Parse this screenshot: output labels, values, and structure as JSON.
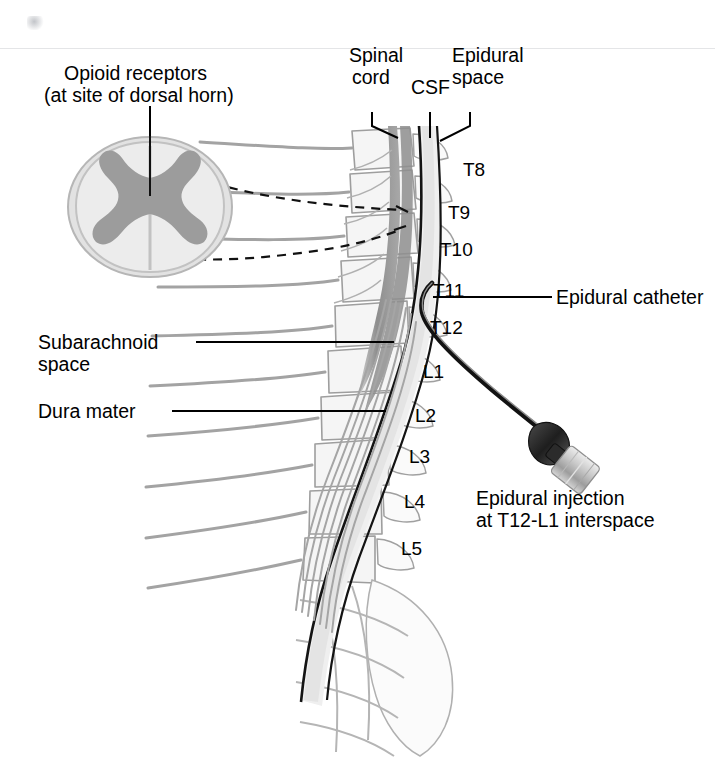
{
  "figure": {
    "type": "medical-anatomical-diagram",
    "background_color": "#ffffff"
  },
  "colors": {
    "ink": "#000000",
    "bone_outline": "#9a9a9a",
    "bone_fill": "#f4f4f4",
    "cord_gray": "#8c8c8c",
    "gray_matter": "#9a9a9a",
    "white_matter": "#d8d8d8",
    "csf_light": "#e8e8e8",
    "catheter": "#1a1a1a",
    "hub_gray": "#b5b5b5",
    "dashed": "#1a1a1a"
  },
  "callouts": {
    "opioid_receptors": {
      "line1": "Opioid receptors",
      "line2": "(at site of dorsal horn)"
    },
    "spinal_cord": {
      "line1": "Spinal",
      "line2": "cord"
    },
    "csf": {
      "line1": "CSF"
    },
    "epidural_space": {
      "line1": "Epidural",
      "line2": "space"
    },
    "epidural_catheter": {
      "line1": "Epidural catheter"
    },
    "subarachnoid_space": {
      "line1": "Subarachnoid",
      "line2": "space"
    },
    "dura_mater": {
      "line1": "Dura mater"
    },
    "epidural_injection": {
      "line1": "Epidural injection",
      "line2": "at T12-L1 interspace"
    }
  },
  "vertebral_levels": [
    {
      "label": "T8",
      "x": 463,
      "y": 160
    },
    {
      "label": "T9",
      "x": 448,
      "y": 203
    },
    {
      "label": "T10",
      "x": 440,
      "y": 240
    },
    {
      "label": "T11",
      "x": 433,
      "y": 281
    },
    {
      "label": "T12",
      "x": 430,
      "y": 318
    },
    {
      "label": "L1",
      "x": 423,
      "y": 362
    },
    {
      "label": "L2",
      "x": 415,
      "y": 406
    },
    {
      "label": "L3",
      "x": 409,
      "y": 447
    },
    {
      "label": "L4",
      "x": 404,
      "y": 492
    },
    {
      "label": "L5",
      "x": 401,
      "y": 539
    }
  ],
  "cross_section": {
    "name": "spinal-cord-cross-section",
    "features": [
      "dorsal horn",
      "ventral horn",
      "gray matter butterfly",
      "white matter",
      "pia/arachnoid outline"
    ]
  },
  "injection_device": {
    "name": "epidural-catheter-connector",
    "parts": [
      "catheter tubing",
      "connector hub",
      "luer adapter"
    ]
  }
}
